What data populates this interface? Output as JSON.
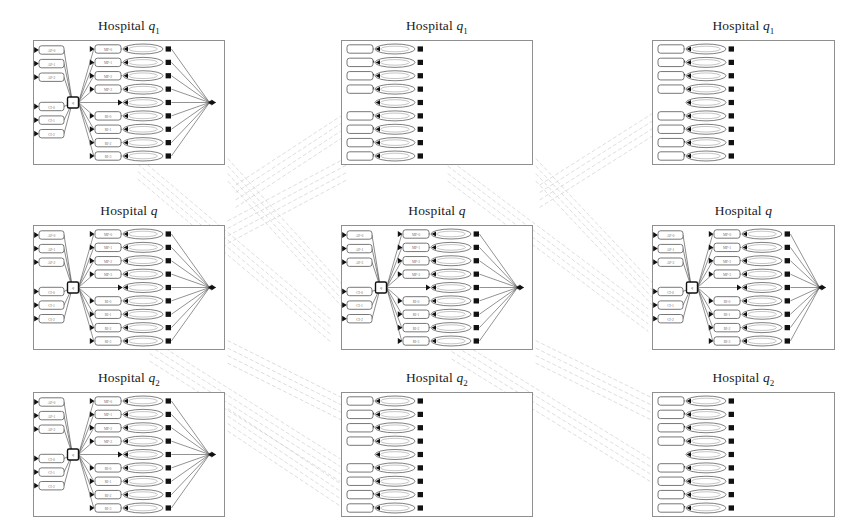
{
  "figure": {
    "kind": "bayesian-network-panel-grid",
    "width": 849,
    "height": 528,
    "background": "#ffffff",
    "rows": 3,
    "cols": 3,
    "scan_quality_note": "low-resolution scanned figure; node labels are illegible smudges"
  },
  "colors": {
    "page_background": "#ffffff",
    "panel_border": "#8f8f8f",
    "node_stroke": "#555555",
    "node_fill": "#ffffff",
    "edge": "#4a4a4a",
    "hub_stroke": "#111111",
    "arrowhead": "#111111",
    "interpanel_link": "#cfcfcf",
    "label_text": "#6e6e6e",
    "title_text": "#1a1a1a"
  },
  "titles": {
    "row1": "Hospital q",
    "row1_sub": "1",
    "row2": "Hospital q",
    "row2_sub": "",
    "row3": "Hospital q",
    "row3_sub": "2"
  },
  "panels": [
    {
      "id": "panel-r1c1",
      "row": 1,
      "col": 1,
      "title": "Hospital q",
      "title_sub": "1",
      "variant": "full",
      "x": 33,
      "y": 40,
      "w": 192,
      "h": 125,
      "input_labels": [
        "AP-0",
        "AP-1",
        "AP-2",
        "CI-0",
        "CI-1",
        "CI-2"
      ],
      "hub_label": "q",
      "mid_labels": [
        "MP-0",
        "MP-1",
        "MP-2",
        "MP-3",
        "",
        "RI-0",
        "RI-1",
        "RI-2",
        "RI-3"
      ]
    },
    {
      "id": "panel-r1c2",
      "row": 1,
      "col": 2,
      "title": "Hospital q",
      "title_sub": "1",
      "variant": "stub",
      "x": 341,
      "y": 40,
      "w": 192,
      "h": 125,
      "input_labels": [],
      "hub_label": "",
      "mid_labels": [
        "",
        "",
        "",
        "",
        "",
        "",
        "",
        "",
        ""
      ]
    },
    {
      "id": "panel-r1c3",
      "row": 1,
      "col": 3,
      "title": "Hospital q",
      "title_sub": "1",
      "variant": "stub",
      "x": 652,
      "y": 40,
      "w": 183,
      "h": 125,
      "input_labels": [],
      "hub_label": "",
      "mid_labels": [
        "",
        "",
        "",
        "",
        "",
        "",
        "",
        "",
        ""
      ]
    },
    {
      "id": "panel-r2c1",
      "row": 2,
      "col": 1,
      "title": "Hospital q",
      "title_sub": "",
      "variant": "full",
      "x": 33,
      "y": 225,
      "w": 192,
      "h": 125,
      "input_labels": [
        "AP-0",
        "AP-1",
        "AP-2",
        "CI-0",
        "CI-1",
        "CI-2"
      ],
      "hub_label": "q",
      "mid_labels": [
        "MP-0",
        "MP-1",
        "MP-2",
        "MP-3",
        "",
        "RI-0",
        "RI-1",
        "RI-2",
        "RI-3"
      ]
    },
    {
      "id": "panel-r2c2",
      "row": 2,
      "col": 2,
      "title": "Hospital q",
      "title_sub": "",
      "variant": "full",
      "x": 341,
      "y": 225,
      "w": 192,
      "h": 125,
      "input_labels": [
        "AP-0",
        "AP-1",
        "AP-2",
        "CI-0",
        "CI-1",
        "CI-2"
      ],
      "hub_label": "q",
      "mid_labels": [
        "MP-0",
        "MP-1",
        "MP-2",
        "MP-3",
        "",
        "RI-0",
        "RI-1",
        "RI-2",
        "RI-3"
      ]
    },
    {
      "id": "panel-r2c3",
      "row": 2,
      "col": 3,
      "title": "Hospital q",
      "title_sub": "",
      "variant": "full",
      "x": 652,
      "y": 225,
      "w": 183,
      "h": 125,
      "input_labels": [
        "AP-0",
        "AP-1",
        "AP-2",
        "CI-0",
        "CI-1",
        "CI-2"
      ],
      "hub_label": "q",
      "mid_labels": [
        "MP-0",
        "MP-1",
        "MP-2",
        "MP-3",
        "",
        "RI-0",
        "RI-1",
        "RI-2",
        "RI-3"
      ]
    },
    {
      "id": "panel-r3c1",
      "row": 3,
      "col": 1,
      "title": "Hospital q",
      "title_sub": "2",
      "variant": "full",
      "x": 33,
      "y": 392,
      "w": 192,
      "h": 125,
      "input_labels": [
        "AP-0",
        "AP-1",
        "AP-2",
        "CI-0",
        "CI-1",
        "CI-2"
      ],
      "hub_label": "q",
      "mid_labels": [
        "MP-0",
        "MP-1",
        "MP-2",
        "MP-3",
        "",
        "RI-0",
        "RI-1",
        "RI-2",
        "RI-3"
      ]
    },
    {
      "id": "panel-r3c2",
      "row": 3,
      "col": 2,
      "title": "Hospital q",
      "title_sub": "2",
      "variant": "stub",
      "x": 341,
      "y": 392,
      "w": 192,
      "h": 125,
      "input_labels": [],
      "hub_label": "",
      "mid_labels": [
        "",
        "",
        "",
        "",
        "",
        "",
        "",
        "",
        ""
      ]
    },
    {
      "id": "panel-r3c3",
      "row": 3,
      "col": 3,
      "title": "Hospital q",
      "title_sub": "2",
      "variant": "stub",
      "x": 652,
      "y": 392,
      "w": 183,
      "h": 125,
      "input_labels": [],
      "hub_label": "",
      "mid_labels": [
        "",
        "",
        "",
        "",
        "",
        "",
        "",
        "",
        ""
      ]
    }
  ],
  "structure": {
    "input_node_count": 6,
    "input_group_split": [
      3,
      3
    ],
    "mid_row_count": 9,
    "mid_rows_with_box": [
      0,
      1,
      2,
      3,
      5,
      6,
      7,
      8
    ],
    "mid_rows_without_box": [
      4
    ],
    "hub_node_count": 1,
    "sink_node_count": 1,
    "node_shapes": {
      "input": "rounded-rect",
      "hub": "square",
      "mid": "rounded-rect",
      "ellipse": "ellipse",
      "sink": "point-arrowhead"
    }
  },
  "interpanel_links": {
    "bundle_count": 6,
    "lines_per_bundle": 4,
    "style": "dashed",
    "color": "#cfcfcf",
    "description": "faint dashed diagonal bundles running from each full panel's sink region up-right and down-right into the stub panels' left-edge ellipse nodes"
  }
}
